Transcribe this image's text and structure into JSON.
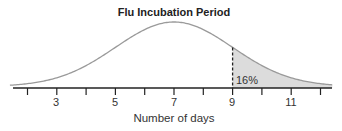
{
  "chart_data": {
    "type": "area",
    "title": "Flu Incubation Period",
    "xlabel": "Number of days",
    "ylabel": "",
    "distribution": "normal",
    "mean": 7,
    "std_dev": 2,
    "xlim": [
      1.6,
      12.4
    ],
    "ticks": [
      2,
      3,
      4,
      5,
      6,
      7,
      8,
      9,
      10,
      11,
      12
    ],
    "tick_labels": [
      "",
      "3",
      "",
      "5",
      "",
      "7",
      "",
      "9",
      "",
      "11",
      ""
    ],
    "shaded_region": {
      "from": 9,
      "to": 12.4,
      "label": "16%",
      "fill": "#dcdcdc"
    },
    "marker_line": {
      "x": 9,
      "style": "dashed"
    },
    "grid": false,
    "legend": null,
    "colors": {
      "curve": "#999999",
      "axis": "#222222",
      "shade": "#dcdcdc"
    }
  },
  "labels": {
    "title": "Flu Incubation Period",
    "xlabel": "Number of days",
    "annotation": "16%",
    "ticks": [
      "3",
      "5",
      "7",
      "9",
      "11"
    ]
  }
}
